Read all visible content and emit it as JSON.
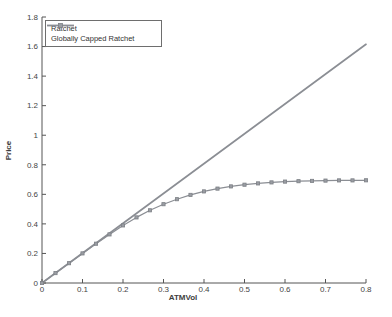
{
  "chart_data": {
    "type": "line",
    "title": "",
    "xlabel": "ATMVol",
    "ylabel": "Price",
    "xlim": [
      0,
      0.8
    ],
    "ylim": [
      0,
      1.8
    ],
    "x_tick_labels": [
      "0",
      "0.1",
      "0.2",
      "0.3",
      "0.4",
      "0.5",
      "0.6",
      "0.7",
      "0.8"
    ],
    "y_tick_labels": [
      "0",
      "0.2",
      "0.4",
      "0.6",
      "0.8",
      "1",
      "1.2",
      "1.4",
      "1.6",
      "1.8"
    ],
    "grid": false,
    "legend_position": "top-left",
    "axis_color": "#555555",
    "tick_label_color": "#444444",
    "series": [
      {
        "name": "Ratchet",
        "marker": "none",
        "color": "#8b8e94",
        "line_width": 1.7,
        "x": [
          0,
          0.8
        ],
        "y": [
          0,
          1.615
        ]
      },
      {
        "name": "Globally Capped Ratchet",
        "marker": "square",
        "color": "#8b8e94",
        "marker_color": "#7d8086",
        "line_width": 1.2,
        "x": [
          0,
          0.0333,
          0.0667,
          0.1,
          0.1333,
          0.1667,
          0.2,
          0.2333,
          0.2667,
          0.3,
          0.3333,
          0.3667,
          0.4,
          0.4333,
          0.4667,
          0.5,
          0.5333,
          0.5667,
          0.6,
          0.6333,
          0.6667,
          0.7,
          0.7333,
          0.7667,
          0.8
        ],
        "y": [
          0,
          0.067,
          0.134,
          0.2,
          0.266,
          0.329,
          0.39,
          0.444,
          0.492,
          0.533,
          0.567,
          0.596,
          0.62,
          0.639,
          0.654,
          0.665,
          0.674,
          0.681,
          0.686,
          0.689,
          0.691,
          0.693,
          0.694,
          0.694,
          0.695
        ]
      }
    ]
  }
}
